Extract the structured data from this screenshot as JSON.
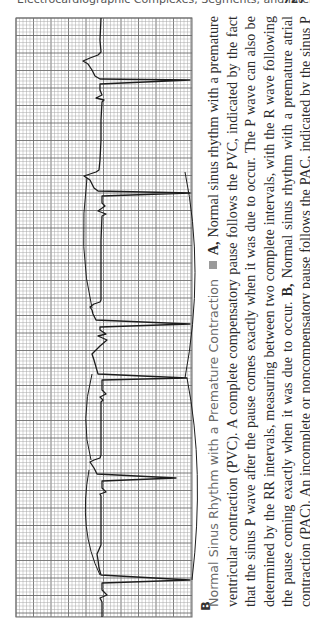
{
  "header": {
    "running_title": "Electrocardiographic Complexes, Segments, and Intervals",
    "page_number": "727"
  },
  "figure": {
    "panel_label": "B",
    "orientation": "rotated 90° counter-clockwise",
    "ecg_strip": {
      "paper": "standard ECG grid (small and large boxes)",
      "rhythm": "Normal sinus rhythm with a premature atrial contraction",
      "beat_sequence": [
        "normal",
        "normal",
        "premature (PAC)",
        "normal",
        "normal"
      ],
      "annotations": "Brackets marking RR intervals across the pause"
    },
    "caption": {
      "title": "Normal Sinus Rhythm with a Premature Contraction",
      "part_a_label": "A,",
      "part_a_text": "Normal sinus rhythm with a premature ventricular contraction (PVC). A complete compensatory pause follows the PVC, indicated by the fact that the sinus P wave after the pause comes exactly when it was due to occur. The P wave can also be determined by the RR intervals, measuring between two complete intervals, with the R wave following the pause coming exactly when it was due to occur.",
      "part_b_label": "B,",
      "part_b_text": "Normal sinus rhythm with a premature atrial contraction (PAC). An incomplete or noncompensatory pause follows the PAC, indicated by the sinus P wave after the pause coming before it was originally due to occur. The QRS complex also comes before it was due."
    }
  },
  "colors": {
    "grid_minor": "#a8a8a8",
    "grid_major": "#6e6e6e",
    "trace": "#1c1c1c",
    "caption_title": "#6a6a6a",
    "bullet": "#9a9a9a"
  }
}
